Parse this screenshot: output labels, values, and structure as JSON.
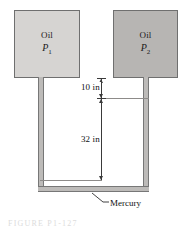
{
  "figure": {
    "type": "engineering-diagram",
    "background_color": "#ffffff"
  },
  "reservoirs": [
    {
      "id": "left",
      "fluid_label": "Oil",
      "pressure_symbol": "P",
      "pressure_subscript": "1",
      "fill_color": "#d6d4d2",
      "border_color": "#6f6f6f"
    },
    {
      "id": "right",
      "fluid_label": "Oil",
      "pressure_symbol": "P",
      "pressure_subscript": "2",
      "fill_color": "#b7b5b3",
      "border_color": "#6f6f6f"
    }
  ],
  "tube": {
    "fill_color": "#bdbbb9",
    "outline_color": "#777777"
  },
  "dimensions": [
    {
      "id": "upper",
      "label": "10 in",
      "value": 10,
      "unit": "in",
      "description": "vertical distance from bottom of right oil reservoir to right mercury level"
    },
    {
      "id": "lower",
      "label": "32 in",
      "value": 32,
      "unit": "in",
      "description": "vertical distance between right mercury level and left mercury level"
    }
  ],
  "callouts": [
    {
      "id": "mercury",
      "label": "Mercury",
      "target": "bottom U-bend of the tube"
    }
  ],
  "caption": {
    "cutoff_text": "FIGURE P1-127"
  }
}
